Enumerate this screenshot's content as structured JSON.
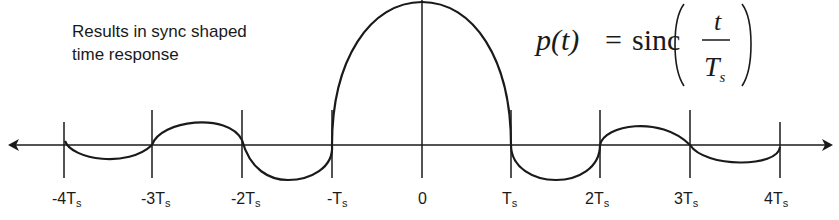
{
  "caption": {
    "line1": "Results in  sync shaped",
    "line2": "time response"
  },
  "formula": {
    "lhs": "p(t)",
    "equals": "=",
    "func": "sinc",
    "numerator": "t",
    "denominator_main": "T",
    "denominator_sub": "s"
  },
  "axis": {
    "ticks": [
      {
        "prefix": "-4T",
        "sub": "s"
      },
      {
        "prefix": "-3T",
        "sub": "s"
      },
      {
        "prefix": "-2T",
        "sub": "s"
      },
      {
        "prefix": "-T",
        "sub": "s"
      },
      {
        "prefix": "0",
        "sub": ""
      },
      {
        "prefix": "T",
        "sub": "s"
      },
      {
        "prefix": "2T",
        "sub": "s"
      },
      {
        "prefix": "3T",
        "sub": "s"
      },
      {
        "prefix": "4T",
        "sub": "s"
      }
    ]
  },
  "colors": {
    "stroke": "#1a1a1a",
    "background": "#ffffff"
  }
}
